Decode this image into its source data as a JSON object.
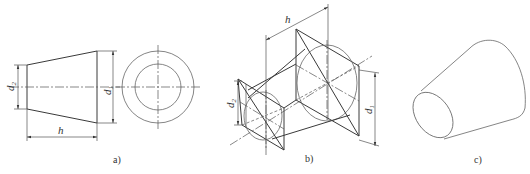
{
  "figure": {
    "panels": [
      {
        "id": "a",
        "caption": "a)",
        "labels": {
          "h": "h",
          "d1": "d",
          "d1_sub": "1",
          "d2": "d",
          "d2_sub": "2"
        }
      },
      {
        "id": "b",
        "caption": "b)",
        "labels": {
          "h": "h",
          "d1": "d",
          "d1_sub": "1",
          "d2": "d",
          "d2_sub": "2"
        }
      },
      {
        "id": "c",
        "caption": "c)"
      }
    ],
    "colors": {
      "line": "#3a3a3a",
      "background": "#ffffff"
    }
  }
}
